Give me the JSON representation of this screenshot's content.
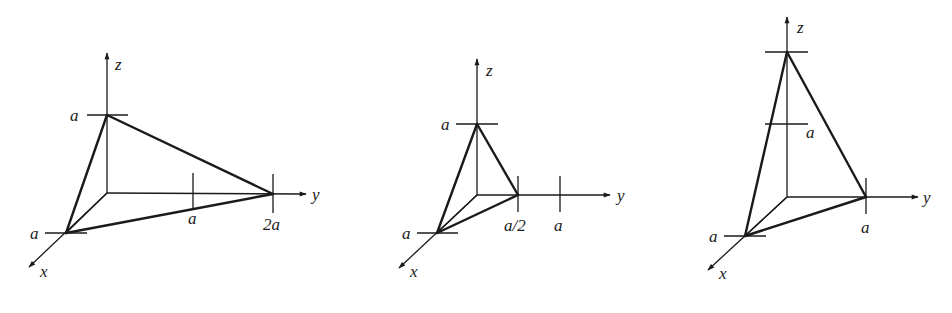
{
  "colors": {
    "ink": "#1a1a1a",
    "background": "#ffffff"
  },
  "diagrams": [
    {
      "id": "tetra-1",
      "axis_labels": {
        "x": "x",
        "y": "y",
        "z": "z"
      },
      "intercepts": {
        "x": "a",
        "y": "2a",
        "z": "a"
      },
      "tick_labels": {
        "x_a": "a",
        "y_a": "a",
        "y_2a": "2a",
        "z_a": "a"
      }
    },
    {
      "id": "tetra-2",
      "axis_labels": {
        "x": "x",
        "y": "y",
        "z": "z"
      },
      "intercepts": {
        "x": "a",
        "y": "a/2",
        "z": "a"
      },
      "tick_labels": {
        "x_a": "a",
        "y_half": "a/2",
        "y_a": "a",
        "z_a": "a"
      }
    },
    {
      "id": "tetra-3",
      "axis_labels": {
        "x": "x",
        "y": "y",
        "z": "z"
      },
      "intercepts": {
        "x": "a",
        "y": "a",
        "z": "2a"
      },
      "tick_labels": {
        "x_a": "a",
        "y_a": "a",
        "z_a": "a"
      }
    }
  ]
}
